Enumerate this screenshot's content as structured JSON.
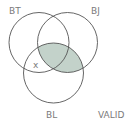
{
  "diagram": {
    "type": "venn",
    "sets": [
      {
        "id": "BT",
        "label": "BT"
      },
      {
        "id": "BJ",
        "label": "BJ"
      },
      {
        "id": "BL",
        "label": "BL"
      }
    ],
    "shaded_region": "BJ ∩ BL",
    "marker": {
      "symbol": "x",
      "region": "BT ∩ BL, not BJ"
    },
    "verdict": "VALID",
    "colors": {
      "stroke": "#555555",
      "shade": "#c3d2ca",
      "text": "#7a7a7a"
    }
  }
}
